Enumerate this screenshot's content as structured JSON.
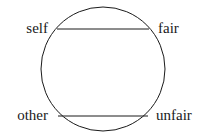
{
  "diagram": {
    "type": "circle-with-chords",
    "background_color": "#ffffff",
    "stroke_color": "#1a1a1a",
    "stroke_width": 1,
    "circle": {
      "center_x": 103,
      "center_y": 69,
      "radius": 62
    },
    "chords": [
      {
        "name": "top-chord",
        "x1": 57,
        "y1": 29,
        "x2": 149,
        "y2": 29
      },
      {
        "name": "bottom-chord",
        "x1": 58,
        "y1": 116,
        "x2": 148,
        "y2": 116
      }
    ],
    "labels": {
      "top_left": "self",
      "top_right": "fair",
      "bottom_left": "other",
      "bottom_right": "unfair"
    }
  }
}
